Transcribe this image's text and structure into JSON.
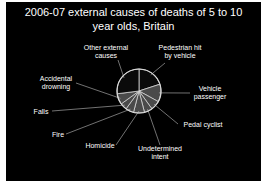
{
  "chart_data": {
    "type": "pie",
    "title": "2006-07 external causes of deaths of 5 to 10 year olds, Britain",
    "title_lines": [
      "2006-07 external causes of deaths of 5 to 10",
      "year olds, Britain"
    ],
    "categories": [
      "Pedestrian hit by vehicle",
      "Vehicle passenger",
      "Pedal cyclist",
      "Undetermined intent",
      "Homicide",
      "Fire",
      "Falls",
      "Accidental drowning",
      "Other external causes"
    ],
    "values": [
      20,
      13,
      7,
      6,
      8,
      6,
      5,
      8,
      27
    ],
    "unit": "percent (estimated from slice angles)",
    "start_angle": "12 o'clock, clockwise",
    "legend": "none (leader-line labels)",
    "colors": {
      "background": "#000000",
      "slice_dark": "#0a0a0a",
      "slice_gray": "#4a4a4a",
      "outline": "#d8d8d8",
      "text": "#ffffff"
    }
  },
  "labels": {
    "other": [
      "Other external",
      "causes"
    ],
    "pedestrian": [
      "Pedestrian hit",
      "by vehicle"
    ],
    "passenger": [
      "Vehicle",
      "passenger"
    ],
    "cyclist": [
      "Pedal cyclist"
    ],
    "undetermined": [
      "Undetermined",
      "intent"
    ],
    "homicide": [
      "Homicide"
    ],
    "fire": [
      "Fire"
    ],
    "falls": [
      "Falls"
    ],
    "drowning": [
      "Accidental",
      "drowning"
    ]
  }
}
